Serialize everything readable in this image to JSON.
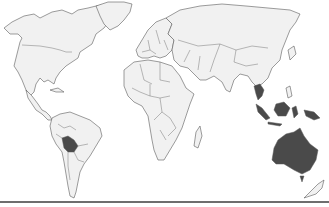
{
  "map": {
    "type": "world-political-outline",
    "style": "grayscale",
    "colors": {
      "land": "#f1f1f1",
      "outline": "#5a5a5a",
      "highlight": "#4a4a4a",
      "background": "#ffffff",
      "baseline": "#6e6e6e"
    },
    "highlighted_regions": [
      {
        "name": "Bolivia",
        "id": "bolivia"
      },
      {
        "name": "Thailand",
        "id": "thailand"
      },
      {
        "name": "Cambodia",
        "id": "cambodia"
      },
      {
        "name": "Malaysia",
        "id": "malaysia"
      },
      {
        "name": "Indonesia",
        "id": "indonesia"
      },
      {
        "name": "Papua New Guinea",
        "id": "papua-new-guinea"
      },
      {
        "name": "Australia",
        "id": "australia"
      }
    ]
  }
}
